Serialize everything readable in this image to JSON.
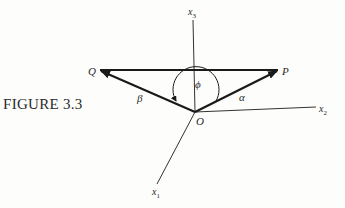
{
  "caption": "FIGURE 3.3",
  "points": {
    "O": {
      "label": "O",
      "x": 195,
      "y": 112
    },
    "P": {
      "label": "P",
      "x": 278,
      "y": 70
    },
    "Q": {
      "label": "Q",
      "x": 100,
      "y": 70
    }
  },
  "axes": {
    "x1": {
      "label": "x",
      "sub": "1"
    },
    "x2": {
      "label": "x",
      "sub": "2"
    },
    "x3": {
      "label": "x",
      "sub": "3"
    }
  },
  "vectors": {
    "alpha": {
      "label": "α",
      "from": "O",
      "to": "P"
    },
    "beta": {
      "label": "β",
      "from": "O",
      "to": "Q"
    },
    "pq": {
      "from": "Q",
      "to": "P"
    }
  },
  "angle": {
    "label": "ϕ",
    "between": [
      "alpha",
      "beta"
    ]
  },
  "colors": {
    "ink": "#1a1a1a",
    "background": "#fdfdfb"
  }
}
